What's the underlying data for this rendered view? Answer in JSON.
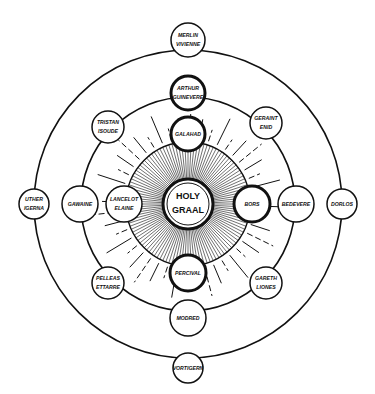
{
  "diagram": {
    "title": "",
    "center": {
      "line1": "HOLY",
      "line2": "GRAAL"
    },
    "figures": [
      {
        "id": "merlin",
        "top": "MERLIN",
        "bottom": "VIVIENNE",
        "ring": "outer",
        "emphasis": "normal"
      },
      {
        "id": "arthur",
        "top": "ARTHUR",
        "bottom": "GUINEVERE",
        "ring": "middle",
        "emphasis": "bold"
      },
      {
        "id": "galahad",
        "top": "",
        "bottom": "GALAHAD",
        "ring": "sun",
        "emphasis": "bold"
      },
      {
        "id": "tristan",
        "top": "TRISTAN",
        "bottom": "ISOUDE",
        "ring": "middle",
        "emphasis": "normal"
      },
      {
        "id": "geraint",
        "top": "GERAINT",
        "bottom": "ENID",
        "ring": "middle",
        "emphasis": "normal"
      },
      {
        "id": "uther",
        "top": "UTHER",
        "bottom": "IGERNA",
        "ring": "outer",
        "emphasis": "normal"
      },
      {
        "id": "gawaine",
        "top": "GAWAINE",
        "bottom": "",
        "ring": "middle",
        "emphasis": "normal"
      },
      {
        "id": "lancelot",
        "top": "LANCELOT",
        "bottom": "ELAINE",
        "ring": "sun",
        "emphasis": "normal"
      },
      {
        "id": "bors",
        "top": "BORS",
        "bottom": "",
        "ring": "sun",
        "emphasis": "bold"
      },
      {
        "id": "bedevere",
        "top": "BEDEVERE",
        "bottom": "",
        "ring": "middle",
        "emphasis": "normal"
      },
      {
        "id": "dorlos",
        "top": "DORLOS",
        "bottom": "",
        "ring": "outer",
        "emphasis": "normal"
      },
      {
        "id": "pelleas",
        "top": "PELLEAS",
        "bottom": "ETTARRE",
        "ring": "middle",
        "emphasis": "normal"
      },
      {
        "id": "gareth",
        "top": "GARETH",
        "bottom": "LIONES",
        "ring": "middle",
        "emphasis": "normal"
      },
      {
        "id": "percival",
        "top": "",
        "bottom": "PERCIVAL",
        "ring": "sun",
        "emphasis": "bold"
      },
      {
        "id": "modred",
        "top": "MODRED",
        "bottom": "",
        "ring": "middle",
        "emphasis": "normal"
      },
      {
        "id": "vortigern",
        "top": "",
        "bottom": "VORTIGERN",
        "ring": "outer",
        "emphasis": "normal"
      }
    ],
    "colors": {
      "ink": "#111111",
      "paper": "#ffffff"
    }
  }
}
